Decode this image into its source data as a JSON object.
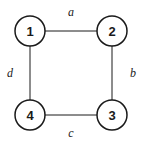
{
  "diagram": {
    "type": "graph",
    "nodes": [
      {
        "id": "1",
        "label": "1",
        "cx": 30,
        "cy": 31
      },
      {
        "id": "2",
        "label": "2",
        "cx": 112,
        "cy": 31
      },
      {
        "id": "3",
        "label": "3",
        "cx": 112,
        "cy": 115
      },
      {
        "id": "4",
        "label": "4",
        "cx": 30,
        "cy": 115
      }
    ],
    "edges": [
      {
        "from": "1",
        "to": "2",
        "label": "a"
      },
      {
        "from": "2",
        "to": "3",
        "label": "b"
      },
      {
        "from": "3",
        "to": "4",
        "label": "c"
      },
      {
        "from": "4",
        "to": "1",
        "label": "d"
      }
    ],
    "colors": {
      "stroke": "#1a1a1a",
      "background": "#ffffff"
    }
  }
}
